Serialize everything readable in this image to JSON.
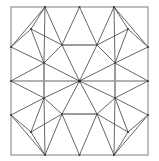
{
  "figure": {
    "type": "line-drawing",
    "width": 159,
    "height": 161,
    "background_color": "#ffffff",
    "line_color": "#4a4a4a",
    "accent_line_color": "#9b9b9b",
    "frame_color": "#8a8a8a",
    "vertex_color": "#3a3a3a"
  },
  "frame": {
    "x": 11,
    "y": 7,
    "width": 137,
    "height": 148,
    "stroke_width": 1.1
  },
  "geometry": {
    "center": {
      "x": 79.5,
      "y": 81
    },
    "vertices": [
      {
        "name": "center",
        "x": 79.5,
        "y": 81
      },
      {
        "name": "top-edge-left",
        "x": 45,
        "y": 7
      },
      {
        "name": "top-edge-mid",
        "x": 79.5,
        "y": 7
      },
      {
        "name": "top-edge-right",
        "x": 114,
        "y": 7
      },
      {
        "name": "bottom-edge-left",
        "x": 45,
        "y": 155
      },
      {
        "name": "bottom-edge-mid",
        "x": 79.5,
        "y": 155
      },
      {
        "name": "bottom-edge-right",
        "x": 114,
        "y": 155
      },
      {
        "name": "left-edge-top",
        "x": 11,
        "y": 47
      },
      {
        "name": "left-edge-mid",
        "x": 11,
        "y": 81
      },
      {
        "name": "left-edge-bottom",
        "x": 11,
        "y": 115
      },
      {
        "name": "right-edge-top",
        "x": 148,
        "y": 47
      },
      {
        "name": "right-edge-mid",
        "x": 148,
        "y": 81
      },
      {
        "name": "right-edge-bottom",
        "x": 148,
        "y": 115
      },
      {
        "name": "inner-nw",
        "x": 44,
        "y": 63
      },
      {
        "name": "inner-ne",
        "x": 115,
        "y": 63
      },
      {
        "name": "inner-sw",
        "x": 44,
        "y": 98
      },
      {
        "name": "inner-se",
        "x": 115,
        "y": 98
      },
      {
        "name": "ring-n-left",
        "x": 62,
        "y": 45
      },
      {
        "name": "ring-n-right",
        "x": 97,
        "y": 45
      },
      {
        "name": "ring-s-left",
        "x": 62,
        "y": 114
      },
      {
        "name": "ring-s-right",
        "x": 97,
        "y": 114
      },
      {
        "name": "corner-nw-outer",
        "x": 31,
        "y": 29
      },
      {
        "name": "corner-ne-outer",
        "x": 128,
        "y": 29
      },
      {
        "name": "corner-sw-outer",
        "x": 31,
        "y": 132
      },
      {
        "name": "corner-se-outer",
        "x": 128,
        "y": 132
      }
    ],
    "edges": [
      {
        "name": "center-to-nw",
        "x1": 79.5,
        "y1": 81,
        "x2": 44,
        "y2": 63
      },
      {
        "name": "center-to-ne",
        "x1": 79.5,
        "y1": 81,
        "x2": 115,
        "y2": 63
      },
      {
        "name": "center-to-sw",
        "x1": 79.5,
        "y1": 81,
        "x2": 44,
        "y2": 98
      },
      {
        "name": "center-to-se",
        "x1": 79.5,
        "y1": 81,
        "x2": 115,
        "y2": 98
      },
      {
        "name": "center-to-n-left",
        "x1": 79.5,
        "y1": 81,
        "x2": 62,
        "y2": 45
      },
      {
        "name": "center-to-n-right",
        "x1": 79.5,
        "y1": 81,
        "x2": 97,
        "y2": 45
      },
      {
        "name": "center-to-s-left",
        "x1": 79.5,
        "y1": 81,
        "x2": 62,
        "y2": 114
      },
      {
        "name": "center-to-s-right",
        "x1": 79.5,
        "y1": 81,
        "x2": 97,
        "y2": 114
      },
      {
        "name": "hex-nw-to-n-left",
        "x1": 44,
        "y1": 63,
        "x2": 62,
        "y2": 45
      },
      {
        "name": "hex-n-right-to-ne",
        "x1": 97,
        "y1": 45,
        "x2": 115,
        "y2": 63
      },
      {
        "name": "hex-ne-to-se",
        "x1": 115,
        "y1": 63,
        "x2": 115,
        "y2": 98
      },
      {
        "name": "hex-se-to-s-right",
        "x1": 115,
        "y1": 98,
        "x2": 97,
        "y2": 114
      },
      {
        "name": "hex-s-left-to-sw",
        "x1": 62,
        "y1": 114,
        "x2": 44,
        "y2": 98
      },
      {
        "name": "hex-sw-to-nw",
        "x1": 44,
        "y1": 98,
        "x2": 44,
        "y2": 63
      },
      {
        "name": "accent-top-bar",
        "x1": 62,
        "y1": 45,
        "x2": 97,
        "y2": 45,
        "accent": true
      },
      {
        "name": "accent-bottom-bar",
        "x1": 62,
        "y1": 114,
        "x2": 97,
        "y2": 114,
        "accent": true
      },
      {
        "name": "accent-left-bar",
        "x1": 44,
        "y1": 63,
        "x2": 44,
        "y2": 98,
        "accent": true
      },
      {
        "name": "accent-right-bar",
        "x1": 115,
        "y1": 63,
        "x2": 115,
        "y2": 98,
        "accent": true
      },
      {
        "name": "nw-diag-to-corner",
        "x1": 44,
        "y1": 63,
        "x2": 31,
        "y2": 29
      },
      {
        "name": "ne-diag-to-corner",
        "x1": 115,
        "y1": 63,
        "x2": 128,
        "y2": 29
      },
      {
        "name": "sw-diag-to-corner",
        "x1": 44,
        "y1": 98,
        "x2": 31,
        "y2": 132
      },
      {
        "name": "se-diag-to-corner",
        "x1": 115,
        "y1": 98,
        "x2": 128,
        "y2": 132
      },
      {
        "name": "nw-corner-to-top",
        "x1": 31,
        "y1": 29,
        "x2": 45,
        "y2": 7
      },
      {
        "name": "ne-corner-to-top",
        "x1": 128,
        "y1": 29,
        "x2": 114,
        "y2": 7
      },
      {
        "name": "sw-corner-to-bottom",
        "x1": 31,
        "y1": 132,
        "x2": 45,
        "y2": 155
      },
      {
        "name": "se-corner-to-bottom",
        "x1": 128,
        "y1": 132,
        "x2": 114,
        "y2": 155
      },
      {
        "name": "nw-corner-to-left",
        "x1": 31,
        "y1": 29,
        "x2": 11,
        "y2": 47
      },
      {
        "name": "ne-corner-to-right",
        "x1": 128,
        "y1": 29,
        "x2": 148,
        "y2": 47
      },
      {
        "name": "sw-corner-to-left",
        "x1": 31,
        "y1": 132,
        "x2": 11,
        "y2": 115
      },
      {
        "name": "se-corner-to-right",
        "x1": 128,
        "y1": 132,
        "x2": 148,
        "y2": 115
      },
      {
        "name": "top-left-apex-a",
        "x1": 45,
        "y1": 7,
        "x2": 62,
        "y2": 45
      },
      {
        "name": "top-left-apex-b",
        "x1": 45,
        "y1": 7,
        "x2": 44,
        "y2": 63
      },
      {
        "name": "top-mid-apex-a",
        "x1": 79.5,
        "y1": 7,
        "x2": 62,
        "y2": 45
      },
      {
        "name": "top-mid-apex-b",
        "x1": 79.5,
        "y1": 7,
        "x2": 97,
        "y2": 45
      },
      {
        "name": "top-right-apex-a",
        "x1": 114,
        "y1": 7,
        "x2": 97,
        "y2": 45
      },
      {
        "name": "top-right-apex-b",
        "x1": 114,
        "y1": 7,
        "x2": 115,
        "y2": 63
      },
      {
        "name": "bottom-left-apex-a",
        "x1": 45,
        "y1": 155,
        "x2": 62,
        "y2": 114
      },
      {
        "name": "bottom-left-apex-b",
        "x1": 45,
        "y1": 155,
        "x2": 44,
        "y2": 98
      },
      {
        "name": "bottom-mid-apex-a",
        "x1": 79.5,
        "y1": 155,
        "x2": 62,
        "y2": 114
      },
      {
        "name": "bottom-mid-apex-b",
        "x1": 79.5,
        "y1": 155,
        "x2": 97,
        "y2": 114
      },
      {
        "name": "bottom-right-apex-a",
        "x1": 114,
        "y1": 155,
        "x2": 97,
        "y2": 114
      },
      {
        "name": "bottom-right-apex-b",
        "x1": 114,
        "y1": 155,
        "x2": 115,
        "y2": 98
      },
      {
        "name": "left-top-apex-a",
        "x1": 11,
        "y1": 47,
        "x2": 44,
        "y2": 63
      },
      {
        "name": "left-mid-apex-a",
        "x1": 11,
        "y1": 81,
        "x2": 44,
        "y2": 63
      },
      {
        "name": "left-mid-apex-b",
        "x1": 11,
        "y1": 81,
        "x2": 44,
        "y2": 98
      },
      {
        "name": "left-bottom-apex-a",
        "x1": 11,
        "y1": 115,
        "x2": 44,
        "y2": 98
      },
      {
        "name": "right-top-apex-a",
        "x1": 148,
        "y1": 47,
        "x2": 115,
        "y2": 63
      },
      {
        "name": "right-mid-apex-a",
        "x1": 148,
        "y1": 81,
        "x2": 115,
        "y2": 63
      },
      {
        "name": "right-mid-apex-b",
        "x1": 148,
        "y1": 81,
        "x2": 115,
        "y2": 98
      },
      {
        "name": "right-bottom-apex-a",
        "x1": 148,
        "y1": 115,
        "x2": 115,
        "y2": 98
      },
      {
        "name": "mid-band-left",
        "x1": 11,
        "y1": 81,
        "x2": 79.5,
        "y2": 81
      },
      {
        "name": "mid-band-right",
        "x1": 79.5,
        "y1": 81,
        "x2": 148,
        "y2": 81
      },
      {
        "name": "nw-inner-cross",
        "x1": 31,
        "y1": 29,
        "x2": 62,
        "y2": 45
      },
      {
        "name": "ne-inner-cross",
        "x1": 128,
        "y1": 29,
        "x2": 97,
        "y2": 45
      },
      {
        "name": "sw-inner-cross",
        "x1": 31,
        "y1": 132,
        "x2": 62,
        "y2": 114
      },
      {
        "name": "se-inner-cross",
        "x1": 128,
        "y1": 132,
        "x2": 97,
        "y2": 114
      },
      {
        "name": "nw-tri-left",
        "x1": 11,
        "y1": 47,
        "x2": 45,
        "y2": 7
      },
      {
        "name": "ne-tri-right",
        "x1": 148,
        "y1": 47,
        "x2": 114,
        "y2": 7
      },
      {
        "name": "sw-tri-left",
        "x1": 11,
        "y1": 115,
        "x2": 45,
        "y2": 155
      },
      {
        "name": "se-tri-right",
        "x1": 148,
        "y1": 115,
        "x2": 114,
        "y2": 155
      }
    ]
  }
}
